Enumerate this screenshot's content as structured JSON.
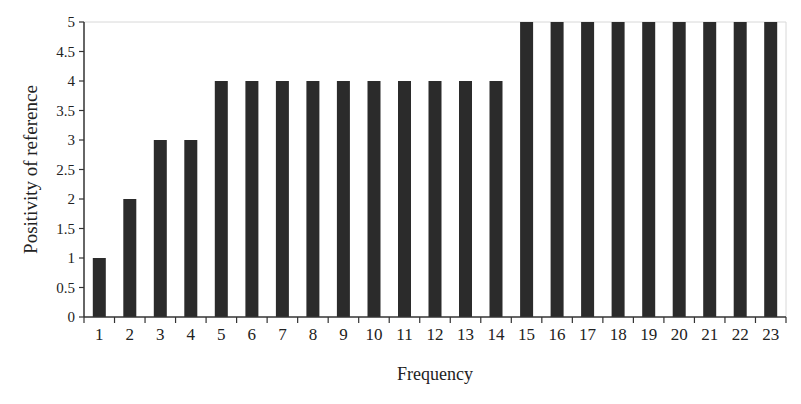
{
  "chart_data": {
    "type": "bar",
    "title": "",
    "xlabel": "Frequency",
    "ylabel": "Positivity of reference",
    "categories": [
      "1",
      "2",
      "3",
      "4",
      "5",
      "6",
      "7",
      "8",
      "9",
      "10",
      "11",
      "12",
      "13",
      "14",
      "15",
      "16",
      "17",
      "18",
      "19",
      "20",
      "21",
      "22",
      "23"
    ],
    "values": [
      1,
      2,
      3,
      3,
      4,
      4,
      4,
      4,
      4,
      4,
      4,
      4,
      4,
      4,
      5,
      5,
      5,
      5,
      5,
      5,
      5,
      5,
      5
    ],
    "ylim": [
      0,
      5
    ],
    "yticks": [
      "0",
      "0.5",
      "1",
      "1.5",
      "2",
      "2.5",
      "3",
      "3.5",
      "4",
      "4.5",
      "5"
    ],
    "grid": false,
    "legend": null,
    "bar_color": "#2b2b2b"
  }
}
